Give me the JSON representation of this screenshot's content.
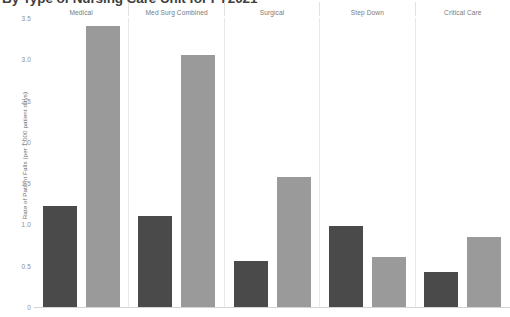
{
  "chart_data": {
    "type": "bar",
    "title": "By Type of Nursing Care Unit for FY2021",
    "xlabel": "",
    "ylabel": "Rate of Patient Falls (per 1,000 patient days)",
    "ylim": [
      0,
      3.5
    ],
    "yticks": [
      "3.5",
      "3.0",
      "2.5",
      "2.0",
      "1.5",
      "1.0",
      "0.5",
      "0"
    ],
    "grid": false,
    "legend_position": "none",
    "categories": [
      "Medical",
      "Med Surg Combined",
      "Surgical",
      "Step Down",
      "Critical Care"
    ],
    "series": [
      {
        "name": "Series 1",
        "color": "#4a4a4a",
        "values": [
          1.22,
          1.1,
          0.56,
          0.98,
          0.42
        ]
      },
      {
        "name": "Series 2",
        "color": "#9a9a9a",
        "values": [
          3.4,
          3.05,
          1.58,
          0.6,
          0.85
        ]
      }
    ]
  }
}
